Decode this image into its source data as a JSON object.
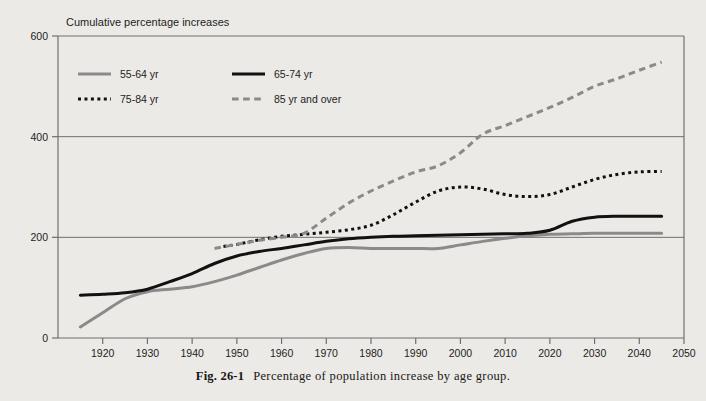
{
  "figure": {
    "caption_number": "Fig. 26-1",
    "caption_text": "Percentage of population increase by age group."
  },
  "colors": {
    "background": "#eceae6",
    "gray_series": "#8a8a8a",
    "black_series": "#111111",
    "axis": "#6f6f6f",
    "text": "#1d1d1d"
  },
  "chart_data": {
    "type": "line",
    "title": "Cumulative percentage increases",
    "xlabel": "",
    "ylabel": "",
    "xlim": [
      1910,
      2050
    ],
    "ylim": [
      0,
      600
    ],
    "yticks": [
      0,
      200,
      400,
      600
    ],
    "xticks": [
      1920,
      1930,
      1940,
      1950,
      1960,
      1970,
      1980,
      1990,
      2000,
      2010,
      2020,
      2030,
      2040,
      2050
    ],
    "grid": "horizontal",
    "legend_position": "top-left-inside",
    "series": [
      {
        "name": "55-64 yr",
        "style": "solid",
        "color": "#8a8a8a",
        "x": [
          1915,
          1920,
          1925,
          1930,
          1935,
          1940,
          1945,
          1950,
          1955,
          1960,
          1965,
          1970,
          1975,
          1980,
          1985,
          1990,
          1995,
          2000,
          2005,
          2010,
          2015,
          2020,
          2025,
          2030,
          2035,
          2040,
          2045
        ],
        "y": [
          22,
          50,
          78,
          92,
          97,
          102,
          112,
          125,
          140,
          155,
          168,
          178,
          180,
          178,
          178,
          178,
          178,
          185,
          192,
          198,
          203,
          206,
          207,
          208,
          208,
          208,
          208
        ]
      },
      {
        "name": "65-74 yr",
        "style": "solid",
        "color": "#111111",
        "x": [
          1915,
          1920,
          1925,
          1930,
          1935,
          1940,
          1945,
          1950,
          1955,
          1960,
          1965,
          1970,
          1975,
          1980,
          1985,
          1990,
          1995,
          2000,
          2005,
          2010,
          2015,
          2020,
          2025,
          2030,
          2035,
          2040,
          2045
        ],
        "y": [
          85,
          87,
          90,
          97,
          112,
          128,
          148,
          163,
          172,
          178,
          185,
          192,
          197,
          200,
          202,
          203,
          204,
          205,
          206,
          207,
          208,
          214,
          232,
          240,
          242,
          242,
          242
        ]
      },
      {
        "name": "75-84 yr",
        "style": "dotted",
        "color": "#111111",
        "x": [
          1947,
          1950,
          1955,
          1960,
          1965,
          1970,
          1975,
          1980,
          1985,
          1990,
          1995,
          2000,
          2005,
          2010,
          2015,
          2020,
          2025,
          2030,
          2035,
          2040,
          2045
        ],
        "y": [
          182,
          186,
          195,
          202,
          206,
          210,
          215,
          224,
          245,
          270,
          292,
          300,
          296,
          285,
          281,
          285,
          300,
          315,
          325,
          330,
          331
        ]
      },
      {
        "name": "85 yr and over",
        "style": "dashed",
        "color": "#8a8a8a",
        "x": [
          1945,
          1950,
          1955,
          1960,
          1965,
          1970,
          1975,
          1980,
          1985,
          1990,
          1995,
          2000,
          2005,
          2010,
          2015,
          2020,
          2025,
          2030,
          2035,
          2040,
          2045
        ],
        "y": [
          178,
          186,
          194,
          200,
          208,
          238,
          268,
          292,
          312,
          330,
          342,
          368,
          405,
          422,
          440,
          458,
          478,
          500,
          515,
          532,
          548
        ]
      }
    ]
  },
  "legend": {
    "items": [
      {
        "label": "55-64 yr",
        "style": "solid",
        "color": "#8a8a8a"
      },
      {
        "label": "65-74 yr",
        "style": "solid",
        "color": "#111111"
      },
      {
        "label": "75-84 yr",
        "style": "dotted",
        "color": "#111111"
      },
      {
        "label": "85 yr and over",
        "style": "dashed",
        "color": "#8a8a8a"
      }
    ]
  }
}
